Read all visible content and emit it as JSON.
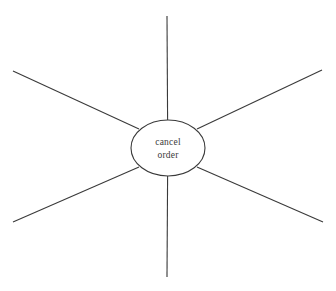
{
  "diagram": {
    "type": "radial-spoke",
    "canvas": {
      "width": 336,
      "height": 291,
      "background": "#ffffff"
    },
    "stroke_color": "#3a3a3a",
    "text_color": "#3a3a3a",
    "hub": {
      "label_line1": "cancel",
      "label_line2": "order",
      "center_x": 168,
      "center_y": 148,
      "radius_x": 37,
      "radius_y": 28
    },
    "spokes": [
      {
        "name": "spoke-top",
        "x1": 167,
        "y1": 16,
        "x2": 167.6,
        "y2": 120
      },
      {
        "name": "spoke-upper-right",
        "x1": 322,
        "y1": 70,
        "x2": 197,
        "y2": 129
      },
      {
        "name": "spoke-lower-right",
        "x1": 323,
        "y1": 222,
        "x2": 197,
        "y2": 167
      },
      {
        "name": "spoke-bottom",
        "x1": 167,
        "y1": 277,
        "x2": 167.6,
        "y2": 176
      },
      {
        "name": "spoke-lower-left",
        "x1": 13,
        "y1": 222,
        "x2": 139,
        "y2": 167
      },
      {
        "name": "spoke-upper-left",
        "x1": 13,
        "y1": 71,
        "x2": 139,
        "y2": 129
      }
    ]
  }
}
